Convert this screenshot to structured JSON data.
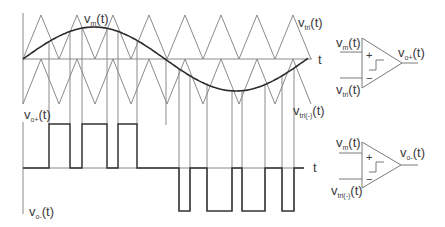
{
  "labels": {
    "modulating": {
      "base": "v",
      "sub": "m",
      "suffix": "(t)"
    },
    "carrier_upper": {
      "base": "v",
      "sub": "tri",
      "suffix": "(t)"
    },
    "carrier_lower": {
      "base": "v",
      "sub": "tri(-)",
      "suffix": "(t)"
    },
    "time_upper": "t",
    "time_lower": "t",
    "output_plus": {
      "base": "v",
      "sub": "o+",
      "suffix": "(t)"
    },
    "output_minus": {
      "base": "v",
      "sub": "o-",
      "suffix": "(t)"
    }
  },
  "comparators": [
    {
      "in_plus": {
        "base": "v",
        "sub": "m",
        "suffix": "(t)"
      },
      "in_minus": {
        "base": "v",
        "sub": "tri",
        "suffix": "(t)"
      },
      "out": {
        "base": "v",
        "sub": "o+",
        "suffix": "(t)"
      },
      "plus_sign": "+",
      "minus_sign": "−"
    },
    {
      "in_plus": {
        "base": "v",
        "sub": "m",
        "suffix": "(t)"
      },
      "in_minus": {
        "base": "v",
        "sub": "tri(-)",
        "suffix": "(t)"
      },
      "out": {
        "base": "v",
        "sub": "o-",
        "suffix": "(t)"
      },
      "plus_sign": "+",
      "minus_sign": "−"
    }
  ],
  "diagram_data": {
    "type": "pwm_waveforms",
    "colors": {
      "carrier": "#8a8a8a",
      "modulating": "#2a2a2a",
      "pulse": "#333333",
      "axis": "#8a8a8a"
    },
    "modulating": {
      "x0": 23,
      "period": 284,
      "center_y": 59,
      "amplitude": 32,
      "x_end": 308
    },
    "carriers": {
      "x0": 23,
      "half_period": 18,
      "zero_y": 59,
      "upper_peak_y": 15,
      "lower_trough_y": 104,
      "x_end": 311
    },
    "upper_plot": {
      "axis_x": 23,
      "axis_top": 13,
      "axis_bottom": 104,
      "zero_y": 59,
      "zero_x_end": 312
    },
    "lower_plot": {
      "axis_x": 23,
      "axis_top": 122,
      "axis_bottom": 214,
      "zero_y": 168,
      "zero_x_end": 304,
      "high_y": 124,
      "low_y": 211
    },
    "positive_pulses": [
      [
        49,
        70
      ],
      [
        82,
        107
      ],
      [
        118,
        137
      ]
    ],
    "negative_pulses": [
      [
        179,
        190
      ],
      [
        207,
        232
      ],
      [
        242,
        265
      ],
      [
        282,
        294
      ]
    ],
    "zero_crossing_marker": {
      "x": 166,
      "y_end": 125
    }
  }
}
